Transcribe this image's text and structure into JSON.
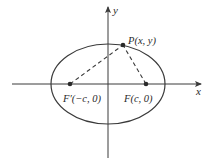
{
  "diagram": {
    "colors": {
      "background": "#ffffff",
      "stroke": "#3a3a3a",
      "text": "#2a2a2a"
    },
    "axes": {
      "x_label": "x",
      "y_label": "y"
    },
    "ellipse": {
      "center": [
        108,
        84
      ],
      "rx": 57,
      "ry": 40
    },
    "points": [
      {
        "id": "P",
        "label": "P(x, y)",
        "pos": [
          123,
          45
        ]
      },
      {
        "id": "F_prime",
        "label": "F′(−c, 0)",
        "pos": [
          70,
          84
        ]
      },
      {
        "id": "F",
        "label": "F(c, 0)",
        "pos": [
          146,
          84
        ]
      }
    ],
    "segments": [
      {
        "from": "F_prime",
        "to": "P",
        "style": "dashed"
      },
      {
        "from": "F",
        "to": "P",
        "style": "dashed"
      }
    ]
  }
}
